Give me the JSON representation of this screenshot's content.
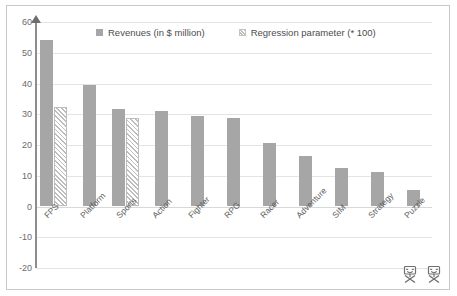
{
  "chart_data": {
    "type": "bar",
    "title": "",
    "subtitle": "",
    "xlabel": "",
    "ylabel": "",
    "ylim": [
      -20,
      60
    ],
    "ytick_values": [
      60,
      50,
      40,
      30,
      20,
      10,
      0,
      -10,
      -20
    ],
    "ytick_labels": [
      "60",
      "50",
      "40",
      "30",
      "20",
      "10",
      "0",
      "-10",
      "-20"
    ],
    "grid": true,
    "legend_position": "top-center",
    "categories": [
      "FPS",
      "Platform",
      "Sports",
      "Action",
      "Fighter",
      "RPG",
      "Racer",
      "Adventure",
      "SIM",
      "Strategy",
      "Puzzle"
    ],
    "series": [
      {
        "name": "Revenues (in $ million)",
        "style": "solid",
        "color": "#a6a6a6",
        "values": [
          54.3,
          39.5,
          31.6,
          31.0,
          29.4,
          28.8,
          20.8,
          16.5,
          12.6,
          11.3,
          5.5
        ]
      },
      {
        "name": "Regression parameter (* 100)",
        "style": "hatched",
        "color": "#bdbdbd",
        "values": [
          32.2,
          null,
          28.8,
          null,
          null,
          null,
          null,
          null,
          null,
          null,
          null
        ]
      }
    ]
  },
  "legend": {
    "entries": [
      {
        "label": "Revenues (in $ million)",
        "style": "solid"
      },
      {
        "label": "Regression parameter (* 100)",
        "style": "hatched"
      }
    ]
  },
  "footer": {
    "icons": [
      "broken-image-icon",
      "broken-image-icon"
    ]
  },
  "colors": {
    "bar_solid": "#a6a6a6",
    "bar_hatch": "#bdbdbd",
    "gridline": "#e4e4e4",
    "axis": "#8d8d8d",
    "frame": "#c9c9c9",
    "tick_text": "#6a6a6a",
    "background": "#ffffff"
  }
}
